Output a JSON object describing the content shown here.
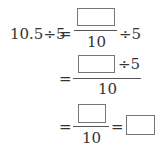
{
  "problem": {
    "row1": {
      "lhs": "10.5÷5",
      "eq": "=",
      "denominator": "10",
      "tail": "÷5",
      "numerator_box": ""
    },
    "row2": {
      "eq": "=",
      "numerator_box": "",
      "numerator_tail": "÷5",
      "denominator": "10"
    },
    "row3": {
      "eq": "=",
      "numerator_box": "",
      "denominator": "10",
      "eq2": "=",
      "answer_box": ""
    }
  }
}
